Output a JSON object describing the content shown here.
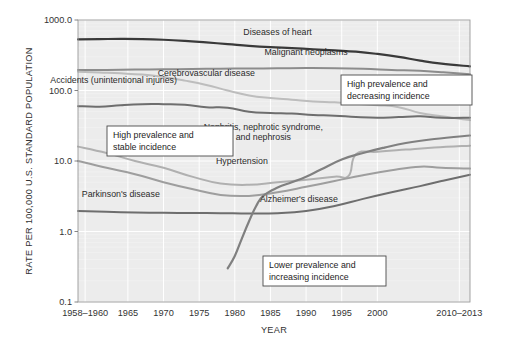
{
  "chart_data": {
    "type": "line",
    "title": "",
    "xlabel": "YEAR",
    "ylabel": "RATE PER 100,000 U.S. STANDARD POPULATION",
    "yscale": "log",
    "ylim": [
      0.1,
      1000.0
    ],
    "ytick_labels": [
      "1000.0",
      "100.0",
      "10.0",
      "1.0",
      "0.1"
    ],
    "ytick_values": [
      1000.0,
      100.0,
      10.0,
      1.0,
      0.1
    ],
    "xtick_labels": [
      "1958–1960",
      "1965",
      "1970",
      "1975",
      "1980",
      "1985",
      "1990",
      "1995",
      "2000",
      "2010–2013"
    ],
    "xtick_values": [
      1959,
      1965,
      1970,
      1975,
      1980,
      1985,
      1990,
      1995,
      2000,
      2011.5
    ],
    "xlim": [
      1958,
      2013
    ],
    "grid": true,
    "legend": "inline-labels",
    "series": [
      {
        "name": "Diseases of heart",
        "color": "#3a3a3a",
        "width": 2.2,
        "label_x": 1986,
        "label_y": 620,
        "x": [
          1958,
          1961,
          1964,
          1967,
          1970,
          1973,
          1976,
          1979,
          1982,
          1985,
          1988,
          1991,
          1994,
          1997,
          2000,
          2003,
          2006,
          2009,
          2013
        ],
        "values": [
          530,
          535,
          540,
          537,
          525,
          505,
          480,
          455,
          430,
          412,
          400,
          385,
          370,
          355,
          330,
          300,
          265,
          240,
          220
        ]
      },
      {
        "name": "Malignant neoplasms",
        "color": "#8c8c8c",
        "width": 2.0,
        "label_x": 1990,
        "label_y": 320,
        "x": [
          1958,
          1962,
          1966,
          1970,
          1974,
          1978,
          1982,
          1986,
          1990,
          1994,
          1998,
          2002,
          2006,
          2009,
          2013
        ],
        "values": [
          195,
          196,
          198,
          200,
          202,
          204,
          205,
          206,
          208,
          207,
          203,
          196,
          190,
          182,
          170
        ]
      },
      {
        "name": "Cerebrovascular disease",
        "color": "#bdbdbd",
        "width": 2.0,
        "label_x": 1976,
        "label_y": 160,
        "x": [
          1958,
          1961,
          1964,
          1967,
          1970,
          1973,
          1976,
          1979,
          1982,
          1985,
          1988,
          1991,
          1994,
          1997,
          2000,
          2003,
          2006,
          2009,
          2013
        ],
        "values": [
          185,
          180,
          175,
          168,
          155,
          138,
          120,
          100,
          85,
          78,
          74,
          70,
          68,
          65,
          62,
          58,
          48,
          43,
          38
        ]
      },
      {
        "name": "Accidents (unintentional injuries)",
        "color": "#6e6e6e",
        "width": 2.0,
        "label_x": 1963,
        "label_y": 128,
        "x": [
          1958,
          1961,
          1964,
          1967,
          1970,
          1973,
          1976,
          1979,
          1982,
          1985,
          1988,
          1991,
          1994,
          1997,
          2000,
          2003,
          2006,
          2009,
          2013
        ],
        "values": [
          60,
          59,
          62,
          64,
          64,
          63,
          58,
          57,
          50,
          48,
          47,
          45,
          44,
          42,
          41,
          42,
          43,
          41,
          41
        ]
      },
      {
        "name": "Nephritis, nephrotic syndrome, and nephrosis",
        "color": "#b0b0b0",
        "width": 2.0,
        "label_x": 1984,
        "label_y": 28,
        "x": [
          1958,
          1962,
          1966,
          1970,
          1974,
          1978,
          1982,
          1986,
          1990,
          1994,
          1996,
          1997,
          2000,
          2004,
          2008,
          2013
        ],
        "values": [
          16,
          13,
          10,
          8,
          6,
          4.8,
          4.6,
          5.0,
          5.4,
          6.0,
          6.2,
          12.5,
          13.5,
          14.5,
          15.5,
          16.5
        ]
      },
      {
        "name": "Hypertension",
        "color": "#9e9e9e",
        "width": 2.0,
        "label_x": 1981,
        "label_y": 9.2,
        "x": [
          1958,
          1962,
          1966,
          1970,
          1974,
          1978,
          1982,
          1986,
          1990,
          1994,
          1998,
          2002,
          2006,
          2009,
          2013
        ],
        "values": [
          10,
          8,
          6.5,
          5.0,
          4.0,
          3.3,
          3.2,
          3.6,
          4.3,
          5.2,
          6.3,
          7.4,
          8.3,
          8.0,
          7.8
        ]
      },
      {
        "name": "Parkinson's disease",
        "color": "#6e6e6e",
        "width": 2.0,
        "label_x": 1964,
        "label_y": 3.1,
        "x": [
          1958,
          1962,
          1966,
          1970,
          1974,
          1978,
          1982,
          1986,
          1990,
          1994,
          1998,
          2002,
          2006,
          2009,
          2013
        ],
        "values": [
          1.95,
          1.9,
          1.86,
          1.84,
          1.83,
          1.82,
          1.8,
          1.82,
          1.95,
          2.3,
          2.9,
          3.6,
          4.4,
          5.2,
          6.4
        ]
      },
      {
        "name": "Alzheimer's disease",
        "color": "#808080",
        "width": 2.2,
        "label_x": 1989,
        "label_y": 2.6,
        "x": [
          1979,
          1980,
          1981,
          1982,
          1983,
          1984,
          1986,
          1988,
          1990,
          1992,
          1995,
          1998,
          2001,
          2004,
          2008,
          2013
        ],
        "values": [
          0.3,
          0.45,
          0.8,
          1.4,
          2.3,
          3.2,
          4.2,
          5.0,
          6.0,
          7.5,
          10.5,
          13.0,
          15.5,
          18.0,
          20.5,
          23.0
        ]
      }
    ],
    "annotations": [
      {
        "id": "high-prevalence-decreasing",
        "lines": [
          "High prevalence and",
          "decreasing incidence"
        ],
        "x": 341,
        "y": 75,
        "w": 131,
        "h": 30
      },
      {
        "id": "high-prevalence-stable",
        "lines": [
          "High prevalence and",
          "stable incidence"
        ],
        "x": 107,
        "y": 126,
        "w": 126,
        "h": 30
      },
      {
        "id": "lower-prevalence-increasing",
        "lines": [
          "Lower prevalence and",
          "increasing incidence"
        ],
        "x": 263,
        "y": 256,
        "w": 123,
        "h": 30
      }
    ]
  }
}
